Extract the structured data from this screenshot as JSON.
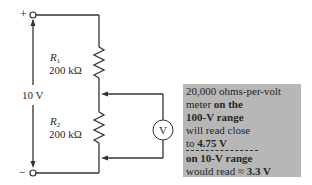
{
  "diagram": {
    "terminals": {
      "positive": "+",
      "negative": "−"
    },
    "source_label": "10 V",
    "resistors": [
      {
        "name": "R",
        "subscript": "1",
        "value": "200 kΩ"
      },
      {
        "name": "R",
        "subscript": "2",
        "value": "200 kΩ"
      }
    ],
    "meter_symbol": "V",
    "note": {
      "line1": "20,000 ohms-per-volt",
      "line2_a": "meter ",
      "line2_b": "on the",
      "line3": "100-V range",
      "line4": "will read close",
      "line5_a": "to ",
      "line5_b": "4.75 V",
      "line6": "on 10-V range",
      "line7_a": "would read ≈ ",
      "line7_b": "3.3 V"
    },
    "colors": {
      "wire": "#333333",
      "note_bg": "#b7b7b7",
      "text": "#2a2a2a"
    }
  }
}
